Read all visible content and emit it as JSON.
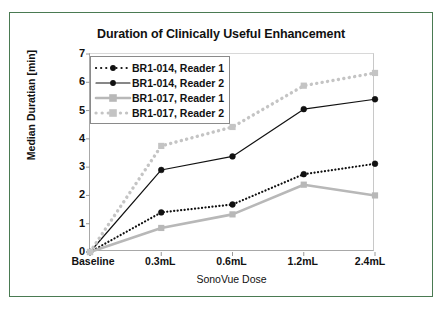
{
  "figure": {
    "border_color": "#4a7a52",
    "background": "#ffffff"
  },
  "chart_data": {
    "type": "line",
    "title": "Duration of Clinically Useful Enhancement",
    "xlabel": "SonoVue Dose",
    "ylabel": "Median Duratian [min]",
    "categories": [
      "Baseline",
      "0.3mL",
      "0.6mL",
      "1.2mL",
      "2.4mL"
    ],
    "ylim": [
      0,
      7
    ],
    "yticks": [
      0,
      1,
      2,
      3,
      4,
      5,
      6,
      7
    ],
    "grid": false,
    "legend_position": "upper-left-inside",
    "series": [
      {
        "name": "BR1-014, Reader 1",
        "values": [
          0,
          1.4,
          1.68,
          2.75,
          3.12
        ],
        "color": "#111111",
        "line_style": "dotted",
        "marker": "circle"
      },
      {
        "name": "BR1-014, Reader 2",
        "values": [
          0,
          2.9,
          3.38,
          5.05,
          5.4
        ],
        "color": "#111111",
        "line_style": "solid",
        "marker": "circle"
      },
      {
        "name": "BR1-017, Reader 1",
        "values": [
          0,
          0.85,
          1.33,
          2.38,
          2.0
        ],
        "color": "#b8b8b8",
        "line_style": "solid",
        "marker": "square"
      },
      {
        "name": "BR1-017, Reader 2",
        "values": [
          0,
          3.75,
          4.42,
          5.88,
          6.33
        ],
        "color": "#c4c4c4",
        "line_style": "dotted",
        "marker": "square"
      }
    ]
  }
}
